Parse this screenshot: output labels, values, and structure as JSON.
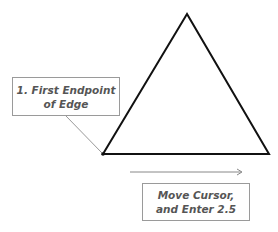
{
  "diagram": {
    "callout_1": {
      "line1": "1. First Endpoint",
      "line2": "of Edge"
    },
    "callout_2": {
      "line1": "Move Cursor,",
      "line2": "and Enter 2.5"
    },
    "triangle": {
      "apex": [
        187,
        14
      ],
      "left": [
        103,
        154
      ],
      "right": [
        269,
        154
      ],
      "stroke": "#111111"
    },
    "arrow": {
      "from": [
        130,
        172
      ],
      "to": [
        242,
        172
      ],
      "color": "#888888"
    }
  }
}
